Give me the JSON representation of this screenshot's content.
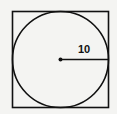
{
  "diagram": {
    "type": "geometry",
    "shapes": {
      "square": {
        "x": 12,
        "y": 11,
        "size": 97,
        "stroke": "#111111"
      },
      "circle": {
        "cx": 60.5,
        "cy": 59.5,
        "r": 48,
        "stroke": "#111111"
      },
      "center_point": {
        "cx": 60.5,
        "cy": 59.5,
        "r": 2
      },
      "radius_line": {
        "x1": 60.5,
        "y1": 59.5,
        "x2": 108.5,
        "y2": 59.5
      }
    },
    "labels": {
      "radius": "10"
    },
    "background": "#f4f4f2"
  }
}
